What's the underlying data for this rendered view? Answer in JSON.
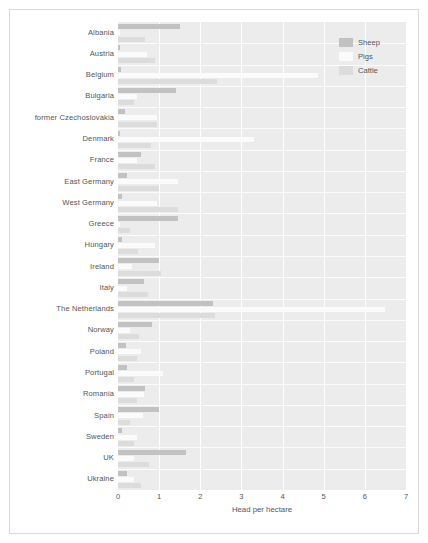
{
  "chart_data": {
    "type": "bar",
    "orientation": "horizontal",
    "title": "",
    "xlabel": "Head per hectare",
    "ylabel": "",
    "xlim": [
      0,
      7
    ],
    "xticks": [
      "0",
      "1",
      "2",
      "3",
      "4",
      "5",
      "6",
      "7"
    ],
    "grid": true,
    "legend_position": "top-right",
    "legend": [
      "Sheep",
      "Pigs",
      "Cattle"
    ],
    "categories": [
      "Albania",
      "Austria",
      "Belgium",
      "Bulgaria",
      "former Czechoslovakia",
      "Denmark",
      "France",
      "East Germany",
      "West Germany",
      "Greece",
      "Hungary",
      "Ireland",
      "Italy",
      "The Netherlands",
      "Norway",
      "Poland",
      "Portugal",
      "Romania",
      "Spain",
      "Sweden",
      "UK",
      "Ukraine"
    ],
    "series": [
      {
        "name": "Sheep",
        "color": "#c2c2c2",
        "values": [
          1.5,
          0.06,
          0.07,
          1.4,
          0.16,
          0.04,
          0.55,
          0.22,
          0.1,
          1.45,
          0.1,
          1.0,
          0.62,
          2.3,
          0.82,
          0.2,
          0.22,
          0.65,
          1.0,
          0.1,
          1.65,
          0.22
        ]
      },
      {
        "name": "Pigs",
        "color": "#fbfbfb",
        "values": [
          0.05,
          0.7,
          4.85,
          0.45,
          0.95,
          3.3,
          0.45,
          1.45,
          0.95,
          0.06,
          0.9,
          0.35,
          0.22,
          6.5,
          0.3,
          0.55,
          1.1,
          0.62,
          0.6,
          0.45,
          0.4,
          0.4
        ]
      },
      {
        "name": "Cattle",
        "color": "#dcdcdc",
        "values": [
          0.65,
          0.9,
          2.4,
          0.4,
          0.95,
          0.8,
          0.9,
          1.0,
          1.45,
          0.3,
          0.48,
          1.05,
          0.72,
          2.35,
          0.52,
          0.45,
          0.4,
          0.45,
          0.3,
          0.38,
          0.75,
          0.55
        ]
      }
    ]
  }
}
